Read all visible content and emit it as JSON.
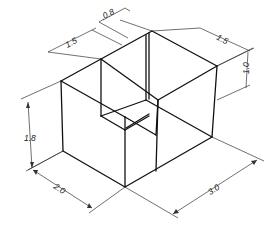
{
  "figure": {
    "type": "isometric technical drawing",
    "line_color": "#111111",
    "dimension_color": "#333333"
  },
  "dimensions": {
    "notch_offset": "0.8",
    "notch_width": "1.5",
    "notch_depth": "1.5",
    "notch_height": "1.0",
    "block_height": "1.8",
    "block_depth": "2.0",
    "block_length": "3.0"
  }
}
